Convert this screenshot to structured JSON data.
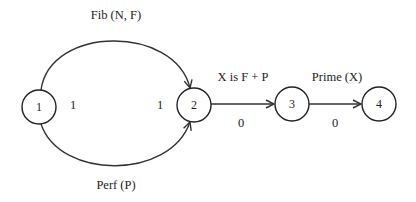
{
  "diagram": {
    "nodes": [
      {
        "id": "1",
        "label": "1"
      },
      {
        "id": "2",
        "label": "2"
      },
      {
        "id": "3",
        "label": "3"
      },
      {
        "id": "4",
        "label": "4"
      }
    ],
    "edges": [
      {
        "from": "1",
        "to": "2",
        "label": "Fib (N, F)",
        "kind": "arc-top"
      },
      {
        "from": "1",
        "to": "2",
        "label": "Perf (P)",
        "kind": "arc-bottom"
      },
      {
        "from": "2",
        "to": "3",
        "label": "X is F + P",
        "weight": "0"
      },
      {
        "from": "3",
        "to": "4",
        "label": "Prime (X)",
        "weight": "0"
      }
    ],
    "side_labels": {
      "node1_out": "1",
      "node2_in": "1"
    },
    "colors": {
      "stroke": "#333333",
      "text": "#222222",
      "background": "#ffffff"
    }
  }
}
